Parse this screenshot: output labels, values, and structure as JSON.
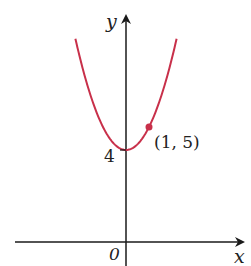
{
  "chart_data": {
    "type": "line",
    "title": "",
    "xlabel": "x",
    "ylabel": "y",
    "function": "y = x^2 + 4",
    "series": [
      {
        "name": "parabola",
        "color": "#c8304a",
        "x": [
          -2.2,
          -2,
          -1.5,
          -1,
          -0.5,
          0,
          0.5,
          1,
          1.5,
          2,
          2.2
        ],
        "y": [
          8.84,
          8,
          6.25,
          5,
          4.25,
          4,
          4.25,
          5,
          6.25,
          8,
          8.84
        ]
      }
    ],
    "annotations": [
      {
        "type": "point",
        "x": 1,
        "y": 5,
        "label": "(1, 5)"
      },
      {
        "type": "tick",
        "axis": "y",
        "value": 4,
        "label": "4"
      },
      {
        "type": "origin",
        "label": "0"
      }
    ],
    "grid": false,
    "legend": null
  },
  "labels": {
    "x_axis": "x",
    "y_axis": "y",
    "origin": "0",
    "y_intercept": "4",
    "point": "(1, 5)"
  },
  "colors": {
    "curve": "#c8304a",
    "axes": "#1a1a1a"
  }
}
